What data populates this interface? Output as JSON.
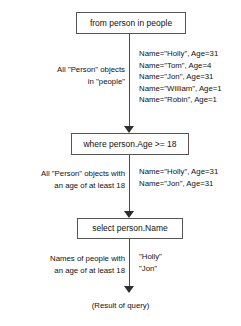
{
  "diagram": {
    "nodes": [
      {
        "id": "from",
        "label": "from person in people"
      },
      {
        "id": "where",
        "label": "where person.Age >= 18"
      },
      {
        "id": "select",
        "label": "select person.Name"
      }
    ],
    "annotations": {
      "all_person_objects": "All \"Person\" objects\nin \"people\"",
      "all_person_objects_line1": "All \"Person\" objects",
      "all_person_objects_line2": "in \"people\"",
      "filtered_line1": "All \"Person\" objects with",
      "filtered_line2": "an age of at least 18",
      "names_line1": "Names of people with",
      "names_line2": "an age of at least 18"
    },
    "data_people": [
      "Name=\"Holly\", Age=31",
      "Name=\"Tom\", Age=4",
      "Name=\"Jon\", Age=31",
      "Name=\"William\", Age=1",
      "Name=\"Robin\", Age=1"
    ],
    "data_adults": [
      "Name=\"Holly\", Age=31",
      "Name=\"Jon\", Age=31"
    ],
    "data_names": [
      "\"Holly\"",
      "\"Jon\""
    ],
    "result_label": "(Result of query)",
    "colors": {
      "box_border": "#555555",
      "connector": "#4a4a4a",
      "arrowhead": "#2e2e2e",
      "text": "#111111",
      "background": "#ffffff"
    }
  }
}
